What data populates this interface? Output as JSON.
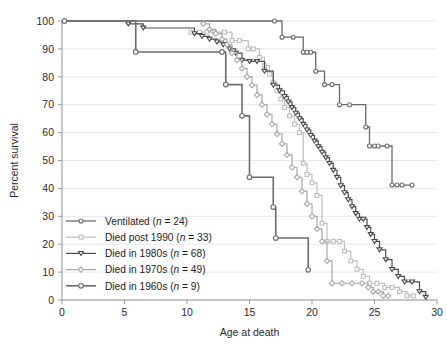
{
  "chart_data": {
    "type": "line",
    "subtype": "kaplan-meier-survival-step",
    "title": "",
    "xlabel": "Age at death",
    "ylabel": "Percent survival",
    "xlim": [
      0,
      30
    ],
    "ylim": [
      0,
      100
    ],
    "xticks": [
      0,
      5,
      10,
      15,
      20,
      25,
      30
    ],
    "xtick_labels": [
      "0",
      "5",
      "10",
      "15",
      "20",
      "25",
      "30"
    ],
    "yticks": [
      0,
      10,
      20,
      30,
      40,
      50,
      60,
      70,
      80,
      90,
      100
    ],
    "ytick_labels": [
      "0",
      "10",
      "20",
      "30",
      "40",
      "50",
      "60",
      "70",
      "80",
      "90",
      "100"
    ],
    "grid": "horizontal",
    "legend_position": "lower-left-inside",
    "series": [
      {
        "name": "Ventilated",
        "n": 24,
        "legend_label": "Ventilated (n = 24)",
        "marker": "circle",
        "color": "#6b6b6b",
        "line_width": 1.3,
        "marker_size": 4.0,
        "x": [
          0.2,
          17.0,
          17.6,
          18.5,
          19.3,
          19.6,
          19.9,
          20.3,
          21.0,
          21.6,
          22.2,
          23.0,
          24.3,
          24.6,
          25.0,
          25.3,
          26.0,
          26.4,
          26.8,
          27.2,
          28.0
        ],
        "y": [
          100,
          100,
          94.2,
          94.2,
          88.8,
          88.8,
          88.8,
          82.0,
          77.2,
          77.2,
          70.0,
          70.0,
          62.0,
          55.2,
          55.2,
          55.2,
          55.2,
          41.2,
          41.2,
          41.2,
          41.2
        ]
      },
      {
        "name": "Died post 1990",
        "n": 33,
        "legend_label": "Died post 1990 (n = 33)",
        "marker": "square",
        "color": "#bdbdbd",
        "line_width": 1.2,
        "marker_size": 3.8,
        "x": [
          10.3,
          11.0,
          11.6,
          12.2,
          13.0,
          13.6,
          14.2,
          14.9,
          15.3,
          15.8,
          16.2,
          16.6,
          16.9,
          17.2,
          17.5,
          17.8,
          18.2,
          18.6,
          19.0,
          19.3,
          19.6,
          20.0,
          20.4,
          20.8,
          21.2,
          21.7,
          22.2,
          22.6,
          23.1,
          23.6,
          24.1,
          24.6,
          25.2,
          25.8,
          26.4,
          27.0,
          27.6,
          28.1
        ],
        "y": [
          96.0,
          96.0,
          96.0,
          96.0,
          96.0,
          93.0,
          93.0,
          90.0,
          90.0,
          87.0,
          84.0,
          81.0,
          78.0,
          75.0,
          72.0,
          69.0,
          66.0,
          63.0,
          60.0,
          49.0,
          45.0,
          42.0,
          37.5,
          27.5,
          21.0,
          21.0,
          21.0,
          17.5,
          14.0,
          11.0,
          8.5,
          6.0,
          6.0,
          4.5,
          4.5,
          3.0,
          1.5,
          1.5
        ]
      },
      {
        "name": "Died in 1980s",
        "n": 68,
        "legend_label": "Died in 1980s (n = 68)",
        "marker": "triangle-down",
        "color": "#4a4a4a",
        "line_width": 1.2,
        "marker_size": 4.0,
        "x": [
          5.3,
          6.5,
          10.6,
          11.2,
          11.8,
          12.4,
          12.9,
          13.4,
          13.9,
          14.4,
          15.0,
          15.6,
          16.2,
          16.9,
          17.4,
          17.8,
          18.1,
          18.4,
          18.7,
          19.0,
          19.3,
          19.6,
          19.9,
          20.2,
          20.5,
          20.8,
          21.1,
          21.4,
          21.7,
          22.0,
          22.3,
          22.6,
          22.9,
          23.2,
          23.5,
          23.8,
          24.1,
          24.4,
          24.7,
          25.0,
          25.4,
          25.9,
          26.4,
          26.9,
          27.4,
          28.0,
          28.6,
          29.1
        ],
        "y": [
          99.0,
          97.5,
          95.5,
          94.5,
          93.5,
          92.5,
          91.5,
          90.0,
          88.5,
          86.0,
          85.5,
          85.5,
          82.0,
          77.0,
          75.0,
          73.0,
          71.0,
          69.0,
          67.0,
          65.0,
          63.0,
          61.0,
          59.0,
          57.0,
          55.0,
          53.0,
          51.0,
          49.0,
          46.5,
          44.0,
          41.0,
          38.5,
          36.0,
          33.5,
          31.0,
          29.0,
          29.0,
          26.0,
          23.5,
          21.0,
          18.0,
          14.5,
          11.0,
          8.5,
          6.5,
          6.5,
          3.0,
          1.0
        ]
      },
      {
        "name": "Died in 1970s",
        "n": 49,
        "legend_label": "Died in 1970s (n = 49)",
        "marker": "diamond",
        "color": "#a8a8a8",
        "line_width": 1.2,
        "marker_size": 4.2,
        "x": [
          11.3,
          11.8,
          12.3,
          12.8,
          13.2,
          13.6,
          14.0,
          14.4,
          14.8,
          15.2,
          15.6,
          16.0,
          16.4,
          16.8,
          17.2,
          17.6,
          18.0,
          18.4,
          18.8,
          19.2,
          19.6,
          20.0,
          20.4,
          20.8,
          21.2,
          21.6,
          22.4,
          23.2,
          24.0,
          24.5,
          24.9,
          25.3,
          25.7,
          26.1
        ],
        "y": [
          99.0,
          97.0,
          95.5,
          93.5,
          91.5,
          88.5,
          86.0,
          83.0,
          80.0,
          77.0,
          73.5,
          70.0,
          66.5,
          63.0,
          59.5,
          56.0,
          52.0,
          47.5,
          44.0,
          39.0,
          34.5,
          30.0,
          25.5,
          21.0,
          14.0,
          6.0,
          6.0,
          6.0,
          6.0,
          4.5,
          3.0,
          3.0,
          1.5,
          1.5
        ]
      },
      {
        "name": "Died in 1960s",
        "n": 9,
        "legend_label": "Died in 1960s (n = 9)",
        "marker": "circle",
        "color": "#6b6b6b",
        "line_width": 1.6,
        "marker_size": 4.6,
        "x": [
          0.2,
          5.9,
          12.8,
          13.1,
          14.4,
          15.0,
          16.9,
          17.1,
          19.7
        ],
        "y": [
          100,
          88.9,
          88.9,
          77.2,
          66.0,
          44.0,
          33.3,
          22.2,
          10.8
        ]
      }
    ]
  },
  "legend": {
    "entries": [
      {
        "label": "Ventilated (n = 24)",
        "name_part": "Ventilated (",
        "ital": "n",
        "tail": " = 24)"
      },
      {
        "label": "Died post 1990 (n = 33)",
        "name_part": "Died post 1990 (",
        "ital": "n",
        "tail": " = 33)"
      },
      {
        "label": "Died in 1980s (n = 68)",
        "name_part": "Died in 1980s (",
        "ital": "n",
        "tail": " = 68)"
      },
      {
        "label": "Died in 1970s (n = 49)",
        "name_part": "Died in 1970s (",
        "ital": "n",
        "tail": " = 49)"
      },
      {
        "label": "Died in 1960s (n = 9)",
        "name_part": "Died in 1960s (",
        "ital": "n",
        "tail": " = 9)"
      }
    ]
  },
  "colors": {
    "ventilated": "#6b6b6b",
    "post1990": "#bdbdbd",
    "d1980s": "#4a4a4a",
    "d1970s": "#a8a8a8",
    "d1960s": "#6b6b6b",
    "axis": "#9a9a9a",
    "grid": "#e4e4e4",
    "text": "#2b2b2b",
    "background": "#ffffff"
  }
}
